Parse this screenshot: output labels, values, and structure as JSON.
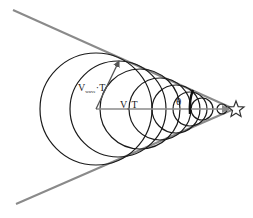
{
  "diagram": {
    "title": "",
    "type": "mach-cone-shock-wave",
    "colors": {
      "background": "#ffffff",
      "cone_line": "#8a8a8a",
      "wavefront": "#1a1a1a",
      "axis": "#8a8a8a",
      "label": "#222222"
    },
    "labels": {
      "wave_speed_main": "V",
      "wave_speed_sub": "wave",
      "wave_speed_suffix": "T",
      "source_speed": "V",
      "source_speed_sub": "s",
      "source_speed_suffix": "T",
      "angle": "θ"
    },
    "source_marker": "star-icon",
    "apex": [
      234,
      109
    ],
    "cone_lines": {
      "upper_start": [
        13,
        10
      ],
      "lower_start": [
        16,
        204
      ]
    },
    "wavefronts": [
      {
        "cx": 96,
        "cy": 109,
        "r": 56
      },
      {
        "cx": 118,
        "cy": 109,
        "r": 48
      },
      {
        "cx": 140,
        "cy": 109,
        "r": 40
      },
      {
        "cx": 160,
        "cy": 109,
        "r": 31
      },
      {
        "cx": 176,
        "cy": 109,
        "r": 24
      },
      {
        "cx": 190,
        "cy": 109,
        "r": 17
      },
      {
        "cx": 202,
        "cy": 109,
        "r": 11
      },
      {
        "cx": 222,
        "cy": 109,
        "r": 5
      }
    ]
  }
}
